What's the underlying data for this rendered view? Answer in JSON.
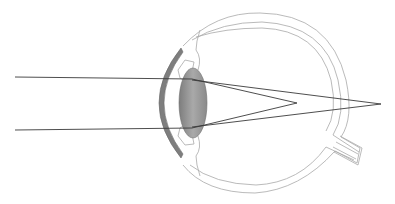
{
  "diagram": {
    "subject": "Eye cross-section with light rays focusing behind the retina",
    "parts": [
      "cornea",
      "iris",
      "lens",
      "ciliary body",
      "sclera",
      "choroid",
      "retina",
      "optic nerve"
    ],
    "colors": {
      "outline": "#9a9a9a",
      "ray": "#3a3a3a",
      "cornea": "#7a7a7a",
      "lens_dark": "#8a8a8a",
      "lens_light": "#c8c8c8",
      "background": "#ffffff"
    },
    "rays": {
      "incoming_upper_y": 77,
      "incoming_lower_y": 130,
      "inner_focus": {
        "x": 297,
        "y": 103
      },
      "outer_focus": {
        "x": 381,
        "y": 104
      }
    }
  }
}
